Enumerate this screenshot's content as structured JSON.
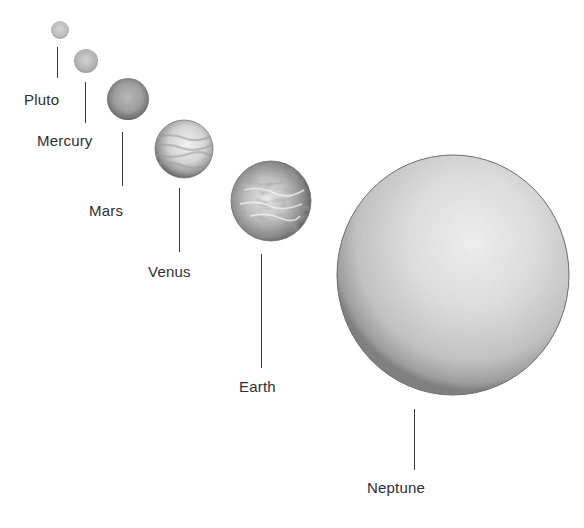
{
  "diagram": {
    "type": "size-comparison",
    "background": "#ffffff",
    "planets": [
      {
        "name": "Pluto",
        "cx": 60,
        "cy": 30,
        "r": 9,
        "texture": "smooth",
        "line": {
          "x": 57,
          "y1": 47,
          "y2": 78
        },
        "label": {
          "x": 24,
          "y": 92
        }
      },
      {
        "name": "Mercury",
        "cx": 86,
        "cy": 61,
        "r": 12,
        "texture": "smooth",
        "line": {
          "x": 85,
          "y1": 82,
          "y2": 123
        },
        "label": {
          "x": 37,
          "y": 133
        }
      },
      {
        "name": "Mars",
        "cx": 128,
        "cy": 99,
        "r": 21,
        "texture": "mottled",
        "line": {
          "x": 122,
          "y1": 132,
          "y2": 186
        },
        "label": {
          "x": 89,
          "y": 203
        }
      },
      {
        "name": "Venus",
        "cx": 184,
        "cy": 149,
        "r": 29,
        "texture": "banded",
        "line": {
          "x": 179,
          "y1": 188,
          "y2": 252
        },
        "label": {
          "x": 148,
          "y": 264
        }
      },
      {
        "name": "Earth",
        "cx": 271,
        "cy": 201,
        "r": 40,
        "texture": "clouds",
        "line": {
          "x": 261,
          "y1": 254,
          "y2": 368
        },
        "label": {
          "x": 239,
          "y": 379
        }
      },
      {
        "name": "Neptune",
        "cx": 453,
        "cy": 275,
        "r": 116,
        "texture": "smooth",
        "line": {
          "x": 414,
          "y1": 409,
          "y2": 470
        },
        "label": {
          "x": 367,
          "y": 480
        }
      }
    ]
  }
}
